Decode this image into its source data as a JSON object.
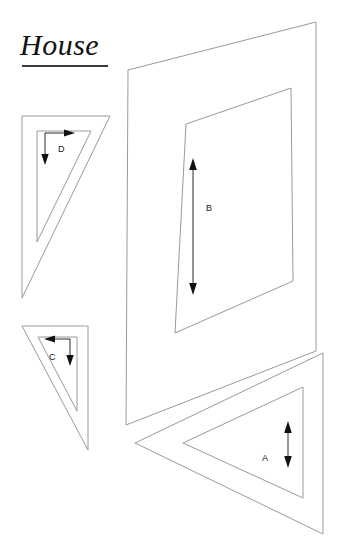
{
  "document": {
    "title": "House",
    "title_style": "italic-serif-underlined"
  },
  "colors": {
    "background": "#ffffff",
    "shape_stroke": "#9a9a9a",
    "dimension_arrow": "#111111",
    "title_text": "#111111",
    "title_rule": "#3a3a3a"
  },
  "pieces": [
    {
      "id": "A",
      "label": "A",
      "name": "piece-a-triangle",
      "shape": "triangle-pointing-left",
      "dimension": {
        "label": "A",
        "arrow": "double-headed-vertical"
      }
    },
    {
      "id": "B",
      "label": "B",
      "name": "piece-b-wall-panel",
      "shape": "quadrilateral-perspective-panel",
      "dimension": {
        "label": "B",
        "arrow": "double-headed-vertical"
      }
    },
    {
      "id": "C",
      "label": "C",
      "name": "piece-c-triangle",
      "shape": "triangle-pointing-down-right",
      "dimension": {
        "label": "C",
        "arrow": "left-and-down"
      }
    },
    {
      "id": "D",
      "label": "D",
      "name": "piece-d-triangle",
      "shape": "triangle-pointing-down-left",
      "dimension": {
        "label": "D",
        "arrow": "right-and-down"
      }
    }
  ]
}
